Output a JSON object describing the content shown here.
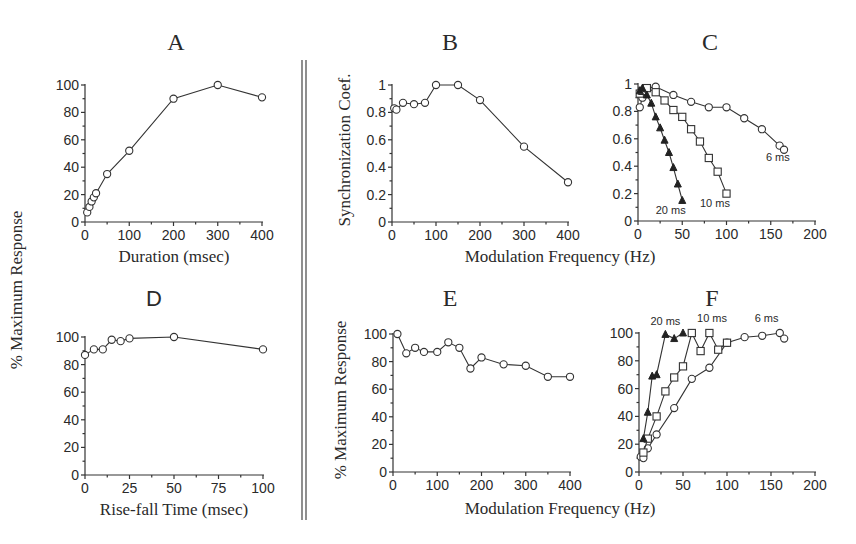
{
  "figure": {
    "divider": {
      "x1": 302,
      "x2": 306,
      "y_top": 60,
      "y_bottom": 520
    },
    "shared_labels": {
      "left_ylabel": "% Maximum Response",
      "top_right_xlabel": "Modulation Frequency (Hz)",
      "bottom_right_xlabel": "Modulation Frequency (Hz)"
    }
  },
  "chart_data": [
    {
      "panel": "A",
      "type": "line",
      "title": "A",
      "xlabel": "Duration (msec)",
      "ylabel": "% Maximum Response",
      "xlim": [
        0,
        400
      ],
      "ylim": [
        0,
        100
      ],
      "xticks": [
        0,
        100,
        200,
        300,
        400
      ],
      "yticks": [
        0,
        20,
        40,
        60,
        80,
        100
      ],
      "grid": false,
      "series": [
        {
          "name": "response",
          "marker": "circle-open",
          "x": [
            5,
            10,
            15,
            20,
            25,
            50,
            100,
            200,
            300,
            400
          ],
          "y": [
            7,
            11,
            15,
            18,
            21,
            35,
            52,
            90,
            100,
            91
          ]
        }
      ]
    },
    {
      "panel": "B",
      "type": "line",
      "title": "B",
      "xlabel": "Modulation Frequency (Hz)",
      "ylabel": "Synchronization Coef.",
      "xlim": [
        0,
        400
      ],
      "ylim": [
        0,
        1
      ],
      "xticks": [
        0,
        100,
        200,
        300,
        400
      ],
      "yticks": [
        0,
        0.2,
        0.4,
        0.6,
        0.8,
        1
      ],
      "grid": false,
      "series": [
        {
          "name": "sync",
          "marker": "circle-open",
          "x": [
            5,
            10,
            25,
            50,
            75,
            100,
            150,
            200,
            300,
            400
          ],
          "y": [
            0.83,
            0.82,
            0.87,
            0.86,
            0.87,
            1.0,
            1.0,
            0.89,
            0.55,
            0.29
          ]
        }
      ]
    },
    {
      "panel": "C",
      "type": "line",
      "title": "C",
      "xlabel": "Modulation Frequency (Hz)",
      "ylabel": "Synchronization Coef.",
      "xlim": [
        0,
        200
      ],
      "ylim": [
        0,
        1
      ],
      "xticks": [
        0,
        50,
        100,
        150,
        200
      ],
      "yticks": [
        0,
        0.2,
        0.4,
        0.6,
        0.8,
        1
      ],
      "grid": false,
      "series": [
        {
          "name": "6 ms",
          "marker": "circle-open",
          "x": [
            2,
            5,
            10,
            20,
            40,
            60,
            80,
            100,
            120,
            140,
            160,
            165
          ],
          "y": [
            0.83,
            0.9,
            0.97,
            0.98,
            0.92,
            0.87,
            0.83,
            0.83,
            0.75,
            0.67,
            0.55,
            0.52
          ],
          "label_pos": {
            "x": 158,
            "y": 0.44
          }
        },
        {
          "name": "10 ms",
          "marker": "square-open",
          "x": [
            2,
            5,
            10,
            20,
            30,
            40,
            50,
            60,
            70,
            80,
            90,
            100
          ],
          "y": [
            0.93,
            0.95,
            0.97,
            0.94,
            0.88,
            0.81,
            0.76,
            0.67,
            0.58,
            0.46,
            0.36,
            0.2
          ],
          "label_pos": {
            "x": 87,
            "y": 0.1
          }
        },
        {
          "name": "20 ms",
          "marker": "triangle-filled",
          "x": [
            2,
            5,
            10,
            15,
            20,
            25,
            30,
            35,
            40,
            45,
            50
          ],
          "y": [
            0.95,
            0.97,
            0.92,
            0.86,
            0.76,
            0.68,
            0.59,
            0.5,
            0.39,
            0.27,
            0.15
          ],
          "label_pos": {
            "x": 37,
            "y": 0.05
          }
        }
      ]
    },
    {
      "panel": "D",
      "type": "line",
      "title": "D",
      "xlabel": "Rise-fall Time (msec)",
      "ylabel": "% Maximum Response",
      "xlim": [
        0,
        100
      ],
      "ylim": [
        0,
        100
      ],
      "xticks": [
        0,
        25,
        50,
        75,
        100
      ],
      "yticks": [
        0,
        20,
        40,
        60,
        80,
        100
      ],
      "grid": false,
      "series": [
        {
          "name": "response",
          "marker": "circle-open",
          "x": [
            0,
            5,
            10,
            15,
            20,
            25,
            50,
            100
          ],
          "y": [
            87,
            91,
            91,
            98,
            97,
            99,
            100,
            91
          ]
        }
      ]
    },
    {
      "panel": "E",
      "type": "line",
      "title": "E",
      "xlabel": "Modulation Frequency (Hz)",
      "ylabel": "% Maximum Response",
      "xlim": [
        0,
        400
      ],
      "ylim": [
        0,
        100
      ],
      "xticks": [
        0,
        100,
        200,
        300,
        400
      ],
      "yticks": [
        0,
        20,
        40,
        60,
        80,
        100
      ],
      "grid": false,
      "series": [
        {
          "name": "response",
          "marker": "circle-open",
          "x": [
            10,
            30,
            50,
            70,
            100,
            125,
            150,
            175,
            200,
            250,
            300,
            350,
            400
          ],
          "y": [
            100,
            86,
            90,
            87,
            87,
            94,
            90,
            75,
            83,
            78,
            77,
            69,
            69
          ]
        }
      ]
    },
    {
      "panel": "F",
      "type": "line",
      "title": "F",
      "xlabel": "Modulation Frequency (Hz)",
      "ylabel": "% Maximum Response",
      "xlim": [
        0,
        200
      ],
      "ylim": [
        0,
        100
      ],
      "xticks": [
        0,
        50,
        100,
        150,
        200
      ],
      "yticks": [
        0,
        20,
        40,
        60,
        80,
        100
      ],
      "grid": false,
      "series": [
        {
          "name": "6 ms",
          "marker": "circle-open",
          "x": [
            2,
            5,
            10,
            20,
            40,
            60,
            80,
            100,
            120,
            140,
            160,
            165
          ],
          "y": [
            11,
            10,
            17,
            27,
            46,
            67,
            75,
            93,
            97,
            98,
            100,
            96
          ],
          "label_pos": {
            "x": 145,
            "y": 108
          }
        },
        {
          "name": "10 ms",
          "marker": "square-open",
          "x": [
            5,
            10,
            20,
            30,
            40,
            50,
            60,
            70,
            80,
            90,
            100
          ],
          "y": [
            14,
            24,
            40,
            58,
            68,
            76,
            100,
            87,
            100,
            88,
            93
          ],
          "label_pos": {
            "x": 83,
            "y": 108
          }
        },
        {
          "name": "20 ms",
          "marker": "triangle-filled",
          "x": [
            5,
            10,
            15,
            20,
            30,
            40,
            50
          ],
          "y": [
            24,
            43,
            69,
            70,
            99,
            96,
            100
          ],
          "label_pos": {
            "x": 30,
            "y": 106
          }
        }
      ]
    }
  ],
  "layout": {
    "A": {
      "x0": 85,
      "x1": 262,
      "y0": 222,
      "y1": 85,
      "title_x": 176,
      "title_y": 50,
      "title_class": "serif",
      "xlabel_x": 174,
      "xlabel_y": 262,
      "ylabel": true,
      "ylabel_x": 22,
      "ylabel_y": 290
    },
    "B": {
      "x0": 392,
      "x1": 568,
      "y0": 222,
      "y1": 85,
      "title_x": 450,
      "title_y": 50,
      "title_class": "serif",
      "ylabel": true,
      "ylabel_x": 350,
      "ylabel_y": 150
    },
    "C": {
      "x0": 638,
      "x1": 815,
      "y0": 221,
      "y1": 84,
      "title_x": 710,
      "title_y": 50,
      "title_class": "serif"
    },
    "D": {
      "x0": 85,
      "x1": 263,
      "y0": 475,
      "y1": 337,
      "title_x": 154,
      "title_y": 306,
      "title_class": "sans",
      "xlabel_x": 174,
      "xlabel_y": 515
    },
    "E": {
      "x0": 393,
      "x1": 570,
      "y0": 472,
      "y1": 334,
      "title_x": 450,
      "title_y": 306,
      "title_class": "serif",
      "ylabel": true,
      "ylabel_x": 346,
      "ylabel_y": 400
    },
    "F": {
      "x0": 639,
      "x1": 815,
      "y0": 472,
      "y1": 333,
      "title_x": 712,
      "title_y": 306,
      "title_class": "serif"
    }
  },
  "xlabels_shared": {
    "top": {
      "text": "Modulation Frequency (Hz)",
      "x": 560,
      "y": 262
    },
    "bottom": {
      "text": "Modulation Frequency (Hz)",
      "x": 560,
      "y": 514
    }
  }
}
